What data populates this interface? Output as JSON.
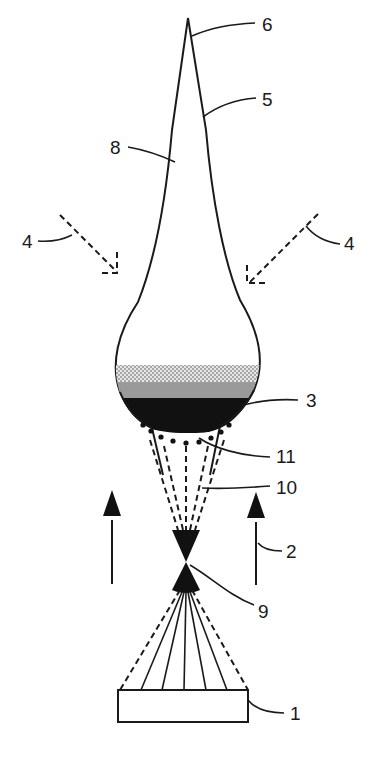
{
  "figure": {
    "type": "patent-style schematic diagram",
    "labels": {
      "l1": "1",
      "l2": "2",
      "l3": "3",
      "l4_left": "4",
      "l4_right": "4",
      "l5": "5",
      "l6": "6",
      "l8": "8",
      "l9": "9",
      "l10": "10",
      "l11": "11"
    },
    "colors": {
      "line": "#1a1a1a",
      "layer_dark": "#111111",
      "layer_mid": "#9a9a9a",
      "layer_light": "#c8c8c8",
      "background": "#ffffff"
    }
  }
}
